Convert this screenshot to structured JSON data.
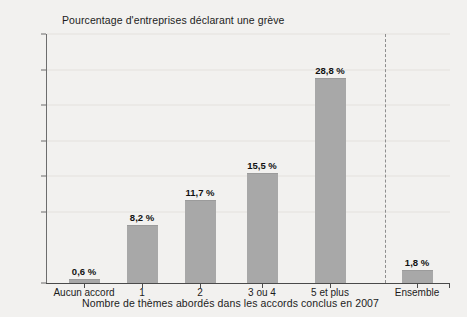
{
  "chart_data": {
    "type": "bar",
    "title": "",
    "ylabel": "Pourcentage d'entreprises déclarant une grève",
    "xlabel": "Nombre de thèmes abordés dans les accords conclus en 2007",
    "categories": [
      "Aucun accord",
      "1",
      "2",
      "3 ou 4",
      "5 et plus",
      "Ensemble"
    ],
    "values": [
      0.6,
      8.2,
      11.7,
      15.5,
      28.8,
      1.8
    ],
    "value_labels": [
      "0,6 %",
      "8,2 %",
      "11,7 %",
      "15,5 %",
      "28,8 %",
      "1,8 %"
    ],
    "ylim": [
      0,
      35
    ],
    "ytick_labels": [
      "0",
      "10",
      "15",
      "20",
      "25",
      "30",
      "35"
    ],
    "ytick_values": [
      0,
      10,
      15,
      20,
      25,
      30,
      35
    ],
    "grid": true,
    "legend": "none",
    "bar_color": "#a8a8a8",
    "separator_after_category": "5 et plus",
    "separator_style": "dashed"
  }
}
